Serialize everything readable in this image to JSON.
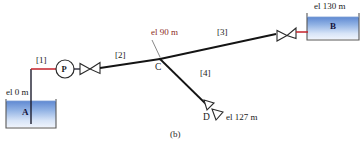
{
  "figure": {
    "caption": "(b)",
    "type": "pipe-network-schematic"
  },
  "tanks": [
    {
      "id": "A",
      "label": "A",
      "elevation_label": "el 0 m",
      "elevation_m": 0
    },
    {
      "id": "B",
      "label": "B",
      "elevation_label": "el 130 m",
      "elevation_m": 130
    }
  ],
  "nodes": [
    {
      "id": "C",
      "label": "C",
      "elevation_label": "el 90 m",
      "elevation_m": 90
    },
    {
      "id": "D",
      "label": "D",
      "elevation_label": "el 127 m",
      "elevation_m": 127
    }
  ],
  "pump": {
    "label": "P",
    "name": "pump"
  },
  "pipes": [
    {
      "id": "1",
      "label": "[1]",
      "from": "A",
      "to": "P"
    },
    {
      "id": "2",
      "label": "[2]",
      "from": "P",
      "to": "C"
    },
    {
      "id": "3",
      "label": "[3]",
      "from": "C",
      "to": "B"
    },
    {
      "id": "4",
      "label": "[4]",
      "from": "C",
      "to": "D"
    }
  ],
  "valves": [
    {
      "id": "valve-pipe-2",
      "on_pipe": "2"
    },
    {
      "id": "valve-pipe-3",
      "on_pipe": "3"
    },
    {
      "id": "valve-pipe-4",
      "on_pipe": "4"
    }
  ],
  "colors": {
    "pipe": "#141414",
    "pipe_highlight": "#c4202a",
    "tank_fill_top": "#5b86d0",
    "tank_fill_bottom": "#e9f0fb",
    "tank_border": "#4a4a4a",
    "label_text": "#1a1a1a",
    "label_red": "#8c2c24"
  }
}
